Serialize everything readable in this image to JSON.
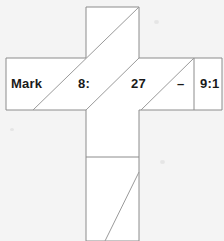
{
  "figure": {
    "kind": "cross-shaped-scan-overlay",
    "background_color": "#f4f4f4",
    "paper_color": "#ffffff",
    "line_color": "#8c8c8c",
    "text_color": "#1a1a1a",
    "canvas": {
      "width": 224,
      "height": 241
    },
    "shape_outline_points": "86,7 139,7 139,58 222,58 222,110 139,110 139,241 86,241 86,110 6,110 6,58 86,58",
    "dividers": [
      {
        "name": "right-cell-divider",
        "orientation": "vertical",
        "x1": 194,
        "y1": 58,
        "x2": 194,
        "y2": 110
      },
      {
        "name": "lower-stem-divider",
        "orientation": "horizontal",
        "x1": 86,
        "y1": 157,
        "x2": 139,
        "y2": 157
      }
    ],
    "diagonals": [
      {
        "name": "diagonal-long-upper-right",
        "x1": 33,
        "y1": 110,
        "x2": 139,
        "y2": 7
      },
      {
        "name": "diagonal-stem-left",
        "x1": 86,
        "y1": 110,
        "x2": 139,
        "y2": 58
      },
      {
        "name": "diagonal-right-arm",
        "x1": 141,
        "y1": 110,
        "x2": 194,
        "y2": 58
      },
      {
        "name": "diagonal-lower-stem",
        "x1": 105,
        "y1": 241,
        "x2": 139,
        "y2": 172
      }
    ],
    "smudges": [
      {
        "x": 154,
        "y": 20,
        "w": 5,
        "h": 4
      },
      {
        "x": 160,
        "y": 160,
        "w": 5,
        "h": 4
      },
      {
        "x": 10,
        "y": 128,
        "w": 4,
        "h": 3
      }
    ]
  },
  "labels": {
    "book": "Mark",
    "chapter": "8:",
    "verse_start": "27",
    "range_dash": "–",
    "verse_end": "9:1"
  },
  "label_positions": [
    {
      "key": "book",
      "name": "label-book",
      "left": 11,
      "top": 77
    },
    {
      "key": "chapter",
      "name": "label-chapter",
      "left": 78,
      "top": 77
    },
    {
      "key": "verse_start",
      "name": "label-verse-start",
      "left": 131,
      "top": 77
    },
    {
      "key": "range_dash",
      "name": "label-range-dash",
      "left": 177,
      "top": 77
    },
    {
      "key": "verse_end",
      "name": "label-verse-end",
      "left": 200,
      "top": 77
    }
  ]
}
